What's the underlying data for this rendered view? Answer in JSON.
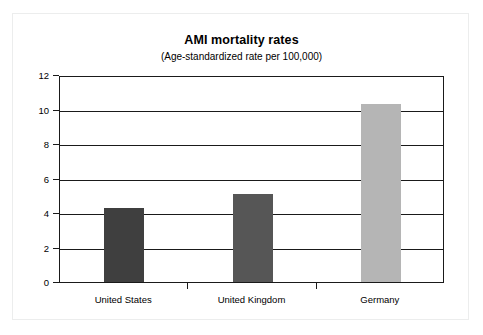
{
  "chart_data": {
    "type": "bar",
    "title": "AMI mortality rates",
    "subtitle": "(Age-standardized rate per 100,000)",
    "categories": [
      "United States",
      "United Kingdom",
      "Germany"
    ],
    "values": [
      4.3,
      5.1,
      10.3
    ],
    "xlabel": "",
    "ylabel": "",
    "ylim": [
      0,
      12
    ],
    "yticks": [
      0,
      2,
      4,
      6,
      8,
      10,
      12
    ],
    "ytick_labels": [
      "0",
      "2",
      "4",
      "6",
      "8",
      "10",
      "12"
    ],
    "grid": "horizontal",
    "legend": "none",
    "bar_colors": [
      "#3f3f3f",
      "#565656",
      "#b5b5b5"
    ],
    "axis_color": "#1a1a1a",
    "frame_color": "#eceded",
    "background": "#ffffff"
  }
}
